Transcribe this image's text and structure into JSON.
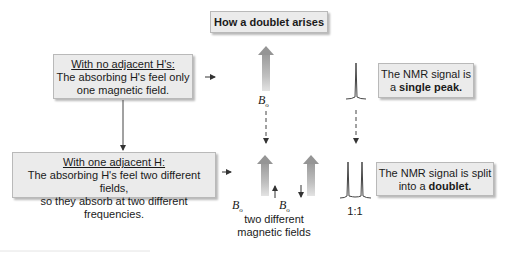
{
  "title": "How a doublet arises",
  "no_adjacent_box": {
    "heading": "With no adjacent H's:",
    "line1": "The absorbing H's feel only",
    "line2": "one magnetic field."
  },
  "one_adjacent_box": {
    "heading": "With one adjacent H:",
    "line1": "The absorbing H's feel two different fields,",
    "line2": "so they absorb at two different frequencies."
  },
  "single_peak_box": {
    "line1": "The NMR signal is",
    "line2_prefix": "a ",
    "line2_bold": "single peak."
  },
  "doublet_box": {
    "line1": "The NMR signal is split",
    "line2_prefix": "into a ",
    "line2_bold": "doublet."
  },
  "field_label": {
    "symbol": "B",
    "subscript": "o"
  },
  "two_fields_caption": {
    "line1": "two different",
    "line2": "magnetic fields"
  },
  "doublet_ratio": "1:1",
  "colors": {
    "box_fill": "#ebebeb",
    "box_border": "#b9b9b9",
    "arrow_gray": "#9a9a9a",
    "text": "#1a1a1a"
  }
}
